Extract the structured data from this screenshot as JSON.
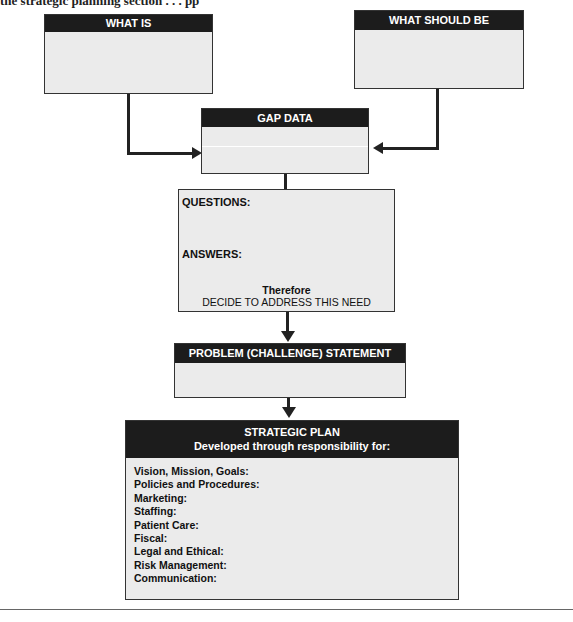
{
  "caption": "the strategic planning section . . . pp",
  "boxes": {
    "what_is": {
      "title": "WHAT IS"
    },
    "what_should_be": {
      "title": "WHAT SHOULD BE"
    },
    "gap_data": {
      "title": "GAP DATA"
    },
    "questions": {
      "questions_label": "QUESTIONS:",
      "answers_label": "ANSWERS:",
      "therefore": "Therefore",
      "decision": "DECIDE TO ADDRESS THIS NEED"
    },
    "problem": {
      "title": "PROBLEM (CHALLENGE) STATEMENT"
    },
    "strategic_plan": {
      "title": "STRATEGIC PLAN",
      "subtitle": "Developed through responsibility for:",
      "items": [
        "Vision, Mission, Goals:",
        "Policies and Procedures:",
        "Marketing:",
        "Staffing:",
        "Patient Care:",
        "Fiscal:",
        "Legal and Ethical:",
        "Risk Management:",
        "Communication:"
      ]
    }
  },
  "colors": {
    "header": "#1c1c1c",
    "box_fill": "#ebebeb",
    "arrow": "#222222"
  }
}
